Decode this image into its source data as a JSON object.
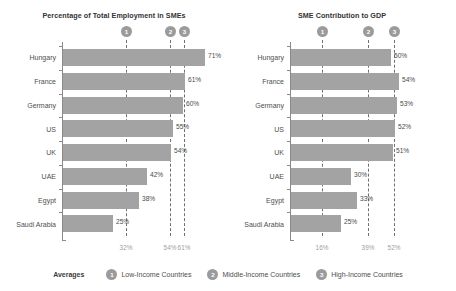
{
  "chart_data": [
    {
      "type": "bar",
      "orientation": "horizontal",
      "title": "Percentage of Total Employment in SMEs",
      "xlabel": "",
      "ylabel": "",
      "xlim": [
        0,
        75
      ],
      "grid": false,
      "categories": [
        "Hungary",
        "France",
        "Germany",
        "US",
        "UK",
        "UAE",
        "Egypt",
        "Saudi Arabia"
      ],
      "values": [
        71,
        61,
        60,
        55,
        54,
        42,
        38,
        25
      ],
      "value_labels": [
        "71%",
        "61%",
        "60%",
        "55%",
        "54%",
        "42%",
        "38%",
        "25%"
      ],
      "reference_lines": [
        {
          "id": "1",
          "value": 32,
          "tick_label": "32%"
        },
        {
          "id": "2",
          "value": 54,
          "tick_label": "54%"
        },
        {
          "id": "3",
          "value": 61,
          "tick_label": "61%"
        }
      ]
    },
    {
      "type": "bar",
      "orientation": "horizontal",
      "title": "SME Contribution to GDP",
      "xlabel": "",
      "ylabel": "",
      "xlim": [
        0,
        75
      ],
      "grid": false,
      "categories": [
        "Hungary",
        "France",
        "Germany",
        "US",
        "UK",
        "UAE",
        "Egypt",
        "Saudi Arabia"
      ],
      "values": [
        50,
        54,
        53,
        52,
        51,
        30,
        33,
        25
      ],
      "value_labels": [
        "50%",
        "54%",
        "53%",
        "52%",
        "51%",
        "30%",
        "33%",
        "25%"
      ],
      "reference_lines": [
        {
          "id": "1",
          "value": 16,
          "tick_label": "16%"
        },
        {
          "id": "2",
          "value": 39,
          "tick_label": "39%"
        },
        {
          "id": "3",
          "value": 52,
          "tick_label": "52%"
        }
      ]
    }
  ],
  "legend": {
    "title": "Averages",
    "position": "bottom",
    "items": [
      {
        "badge": "1",
        "label": "Low-Income Countries"
      },
      {
        "badge": "2",
        "label": "Middle-Income Countries"
      },
      {
        "badge": "3",
        "label": "High-Income Countries"
      }
    ]
  },
  "colors": {
    "bar": "#a3a3a3",
    "reference_line": "#6f6f6f",
    "badge": "#9b9b9b",
    "text": "#4e4e4e",
    "tick_text": "#9e9e9e",
    "background": "#ffffff"
  }
}
